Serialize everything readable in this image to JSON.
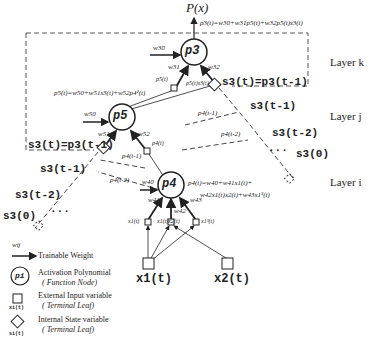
{
  "output": {
    "label": "P(x)",
    "equation": "p3(t)=w30+w31p5(t)+w32p5(t)s3(t)"
  },
  "layers": {
    "k": "Layer k",
    "j": "Layer j",
    "i": "Layer i"
  },
  "nodes": {
    "p3": "p3",
    "p5": "p5",
    "p4": "p4"
  },
  "equations": {
    "p5": "p5(t)=w50+w51s3(t)+w52p4²(t)",
    "p4_line1": "p4(t)=w40+w41x1(t)+",
    "p4_line2": "w42x1(t)x2(t)+w43x1³(t)"
  },
  "weights": {
    "w30": "w30",
    "w31": "w31",
    "w32": "w32",
    "w50": "w50",
    "w51": "w51",
    "w52": "w52",
    "w40": "w40",
    "w41": "w41",
    "w42": "w42",
    "w43": "w43"
  },
  "edge_labels": {
    "p5t": "p5(t)",
    "p5s3": "p5(t)s3(t)",
    "p4t": "p4(t)",
    "p4_tm1_j": "p4(t-1)",
    "p4_tm1_i": "p4(t-1)",
    "p4_tm2_j": "p4(t-2)",
    "p4_tm2_i": "p4(t-2)",
    "x1t": "x1(t)",
    "x1x2": "x1(t)x2(t)",
    "x1cube": "x1³(t)"
  },
  "states": {
    "k_main": "s3(t)=p3(t-1)",
    "k_tm1": "s3(t-1)",
    "k_tm2": "s3(t-2)",
    "k_0": "s3(0)",
    "j_main": "s3(t)=p3(t-1)",
    "j_tm1": "s3(t-1)",
    "j_tm2": "s3(t-2)",
    "j_0": "s3(0)",
    "ellipsis": "..."
  },
  "inputs": {
    "x1": "x1(t)",
    "x2": "x2(t)"
  },
  "legend": {
    "weight_symbol": "wij",
    "weight_label": "Trainable Weight",
    "poly_symbol": "pi",
    "poly_label": "Activation Polynomial",
    "poly_sub": "( Function Node)",
    "ext_symbol": "xi(t)",
    "ext_label": "External Input variable",
    "ext_sub": "( Terminal Leaf)",
    "int_symbol": "si(t)",
    "int_label": "Internal State variable",
    "int_sub": "( Terminal Leaf)"
  }
}
